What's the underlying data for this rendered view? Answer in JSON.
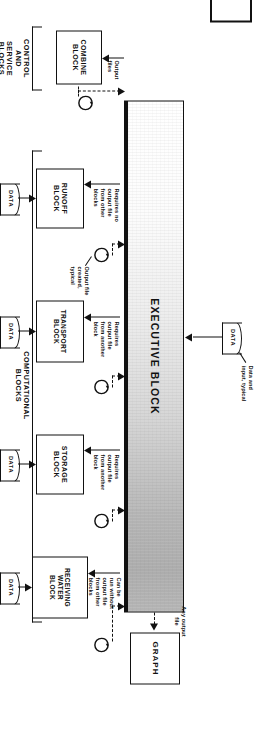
{
  "figure": {
    "type": "flow-diagram",
    "orientation": "rotated-90-ccw"
  },
  "blocks": {
    "executive": {
      "label": "EXECUTIVE BLOCK",
      "name": "executive-block"
    },
    "graph": {
      "label": "GRAPH",
      "name": "graph-block"
    },
    "combine": {
      "label": "COMBINE\nBLOCK",
      "line1": "COMBINE",
      "line2": "BLOCK"
    },
    "runoff": {
      "line1": "RUNOFF",
      "line2": "BLOCK"
    },
    "transport": {
      "line1": "TRANSPORT",
      "line2": "BLOCK"
    },
    "storage": {
      "line1": "STORAGE",
      "line2": "BLOCK"
    },
    "receiving": {
      "line1": "RECEIVING",
      "line2": "WATER",
      "line3": "BLOCK"
    }
  },
  "data_symbols": {
    "label": "DATA",
    "count": 5
  },
  "annotations": {
    "any_output_file": "Any output\nfile",
    "any_output_file_l1": "Any output",
    "any_output_file_l2": "file",
    "data_and_input_typical_l1": "Data and",
    "data_and_input_typical_l2": "input, typical",
    "output_files_l1": "Output",
    "output_files_l2": "files",
    "output_file_created_l1": "Output file",
    "output_file_created_l2": "created,",
    "output_file_created_l3": "typical",
    "requires_no_output_l1": "Requires no",
    "requires_no_output_l2": "output file",
    "requires_no_output_l3": "from other",
    "requires_no_output_l4": "blocks",
    "requires_output_another_l1": "Requires",
    "requires_output_another_l2": "output file",
    "requires_output_another_l3": "from another",
    "requires_output_another_l4": "block",
    "can_be_run_l1": "Can be",
    "can_be_run_l2": "run without",
    "can_be_run_l3": "output file",
    "can_be_run_l4": "from other",
    "can_be_run_l5": "blocks"
  },
  "groups": {
    "control": {
      "l1": "CONTROL",
      "l2": "AND",
      "l3": "SERVICE",
      "l4": "BLOCKS"
    },
    "computational": {
      "l1": "COMPUTATIONAL",
      "l2": "BLOCKS"
    }
  },
  "colors": {
    "ink": "#111111",
    "paper": "#ffffff",
    "bar_fill_light": "#ffffff",
    "bar_fill_dark": "#b2b2b2"
  }
}
